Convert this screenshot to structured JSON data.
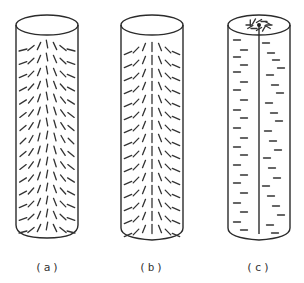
{
  "figure": {
    "panels": [
      {
        "id": "a",
        "label": "(a)",
        "description": "cylinder with dashes radiating in chevron/fan patterns, converging at mid-height (random-like orientation)"
      },
      {
        "id": "b",
        "label": "(b)",
        "description": "cylinder with dashes arranged in upward-pointing chevron (herringbone) pattern along central axis"
      },
      {
        "id": "c",
        "label": "(c)",
        "description": "cylinder with central axial line, radial pattern on top face, horizontal dashes along length"
      }
    ],
    "colors": {
      "ink": "#2b2b2b",
      "background": "#ffffff"
    }
  }
}
